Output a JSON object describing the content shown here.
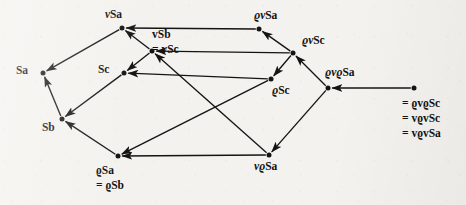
{
  "figure": {
    "kind": "directed-graph",
    "background_color": "#f4f2ee",
    "ink_color": "#141414"
  },
  "nodes": [
    {
      "id": "vSa",
      "label": "vSa",
      "label_italic_prefix": "v",
      "x": 122,
      "y": 28,
      "label_x": 105,
      "label_y": 8
    },
    {
      "id": "vSb",
      "label": "vSb",
      "label_italic_prefix": "v",
      "x": 152,
      "y": 51,
      "label_x": 152,
      "label_y": 27
    },
    {
      "id": "Sa",
      "label": "Sa",
      "label_italic_prefix": "",
      "x": 43,
      "y": 73,
      "label_x": 16,
      "label_y": 64
    },
    {
      "id": "Sc",
      "label": "Sc",
      "label_italic_prefix": "",
      "x": 124,
      "y": 73,
      "label_x": 98,
      "label_y": 63
    },
    {
      "id": "Sb",
      "label": "Sb",
      "label_italic_prefix": "",
      "x": 62,
      "y": 119,
      "label_x": 42,
      "label_y": 121
    },
    {
      "id": "rSa",
      "label": "ϱSa",
      "label_italic_prefix": "",
      "x": 118,
      "y": 156,
      "label_x": 103,
      "label_y": 163
    },
    {
      "id": "rvSa",
      "label": "ϱvSa",
      "label_italic_prefix": "",
      "x": 259,
      "y": 29,
      "label_x": 254,
      "label_y": 9
    },
    {
      "id": "rvSc",
      "label": "ϱvSc",
      "label_italic_prefix": "",
      "x": 293,
      "y": 53,
      "label_x": 302,
      "label_y": 34
    },
    {
      "id": "rSc",
      "label": "ϱSc",
      "label_italic_prefix": "",
      "x": 271,
      "y": 79,
      "label_x": 272,
      "label_y": 84
    },
    {
      "id": "rvrSa",
      "label": "ϱvϱSa",
      "label_italic_prefix": "",
      "x": 328,
      "y": 88,
      "label_x": 325,
      "label_y": 66
    },
    {
      "id": "vrSa",
      "label": "vϱSa",
      "label_italic_prefix": "v",
      "x": 269,
      "y": 155,
      "label_x": 254,
      "label_y": 160
    },
    {
      "id": "rvScR",
      "label": "ϱvSc",
      "label_italic_prefix": "",
      "x": 414,
      "y": 88,
      "label_x": 407,
      "label_y": 62
    }
  ],
  "alias_groups": [
    {
      "id": "vSb-alias",
      "anchor_node": "vSb",
      "x": 152,
      "y": 27,
      "lines": [
        "vSb",
        "= vSc"
      ],
      "italic": true
    },
    {
      "id": "rSa-alias",
      "anchor_node": "rSa",
      "x": 96,
      "y": 163,
      "lines": [
        "ϱSa",
        "= ϱSb"
      ],
      "italic": false
    },
    {
      "id": "rvSc-right-alias",
      "anchor_node": "rvScR",
      "x": 402,
      "y": 96,
      "lines": [
        "= ϱvϱSc",
        "= vϱvSc",
        "= vϱvSa"
      ],
      "italic": false
    }
  ],
  "edges": [
    {
      "id": "e1",
      "from": "vSa",
      "to": "Sa",
      "shape": "line"
    },
    {
      "id": "e2",
      "from": "vSb",
      "to": "vSa",
      "shape": "line"
    },
    {
      "id": "e3",
      "from": "vSb",
      "to": "Sc",
      "shape": "line"
    },
    {
      "id": "e4",
      "from": "Sc",
      "to": "Sb",
      "shape": "line"
    },
    {
      "id": "e5",
      "from": "Sb",
      "to": "Sa",
      "shape": "line"
    },
    {
      "id": "e6",
      "from": "rSa",
      "to": "Sb",
      "shape": "line"
    },
    {
      "id": "e7",
      "from": "rvSa",
      "to": "vSa",
      "shape": "line"
    },
    {
      "id": "e8",
      "from": "rvSc",
      "to": "rvSa",
      "shape": "line"
    },
    {
      "id": "e9",
      "from": "rvSc",
      "to": "vSb",
      "shape": "line"
    },
    {
      "id": "e10",
      "from": "rvSc",
      "to": "rSc",
      "shape": "line"
    },
    {
      "id": "e11",
      "from": "rSc",
      "to": "Sc",
      "shape": "line"
    },
    {
      "id": "e12",
      "from": "rSc",
      "to": "rSa",
      "shape": "line"
    },
    {
      "id": "e13",
      "from": "vrSa",
      "to": "vSb",
      "shape": "line"
    },
    {
      "id": "e14",
      "from": "vrSa",
      "to": "rSa",
      "shape": "line"
    },
    {
      "id": "e15",
      "from": "rvrSa",
      "to": "rvSc",
      "shape": "line"
    },
    {
      "id": "e16",
      "from": "rvrSa",
      "to": "vrSa",
      "shape": "line"
    },
    {
      "id": "e17",
      "from": "rvScR",
      "to": "rvrSa",
      "shape": "line"
    }
  ]
}
